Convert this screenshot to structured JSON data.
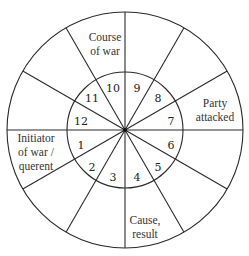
{
  "diagram": {
    "type": "astrological-chart-wheel",
    "houses": [
      {
        "number": "1",
        "x": 81,
        "y": 149
      },
      {
        "number": "2",
        "x": 92,
        "y": 171
      },
      {
        "number": "3",
        "x": 113,
        "y": 181
      },
      {
        "number": "4",
        "x": 137,
        "y": 181
      },
      {
        "number": "5",
        "x": 158,
        "y": 171
      },
      {
        "number": "6",
        "x": 171,
        "y": 149
      },
      {
        "number": "7",
        "x": 171,
        "y": 125
      },
      {
        "number": "8",
        "x": 158,
        "y": 102
      },
      {
        "number": "9",
        "x": 137,
        "y": 92
      },
      {
        "number": "10",
        "x": 113,
        "y": 92
      },
      {
        "number": "11",
        "x": 92,
        "y": 102
      },
      {
        "number": "12",
        "x": 81,
        "y": 125
      }
    ],
    "labels": {
      "course_of_war": {
        "line1": "Course",
        "line2": "of war"
      },
      "party_attacked": {
        "line1": "Party",
        "line2": "attacked"
      },
      "initiator": {
        "line1": "Initiator",
        "line2": "of war /",
        "line3": "querent"
      },
      "cause_result": {
        "line1": "Cause,",
        "line2": "result"
      }
    },
    "colors": {
      "line": "#2a2a2a",
      "background": "#ffffff"
    }
  }
}
